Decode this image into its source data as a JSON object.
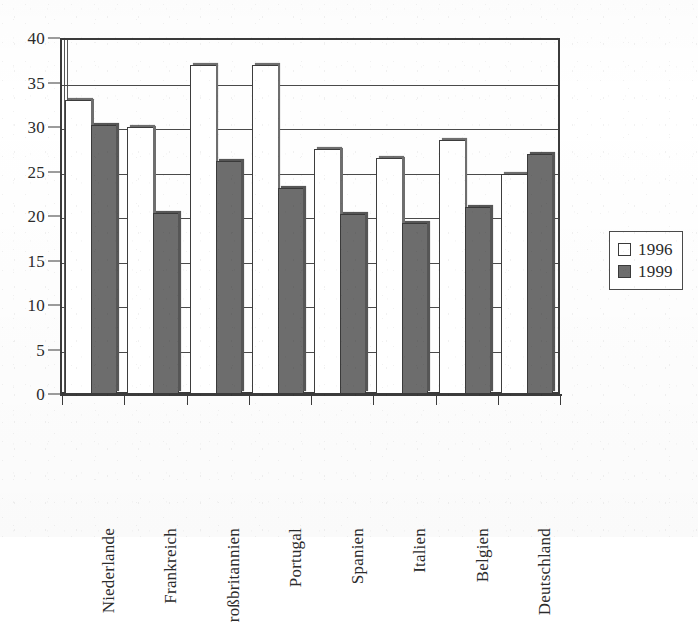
{
  "chart_data": {
    "type": "bar",
    "title": "",
    "xlabel": "",
    "ylabel": "",
    "ylim": [
      0,
      40
    ],
    "ytick_step": 5,
    "yticks": [
      0,
      5,
      10,
      15,
      20,
      25,
      30,
      35,
      40
    ],
    "grid": true,
    "legend_position": "right-outside",
    "categories": [
      "Niederlande",
      "Frankreich",
      "Großbritannien",
      "Portugal",
      "Spanien",
      "Italien",
      "Belgien",
      "Deutschland"
    ],
    "series": [
      {
        "name": "1996",
        "color": "#ffffff",
        "values": [
          33.0,
          30.0,
          37.0,
          37.0,
          27.5,
          26.5,
          28.5,
          24.7
        ]
      },
      {
        "name": "1999",
        "color": "#6d6d6d",
        "values": [
          30.2,
          20.3,
          26.2,
          23.2,
          20.2,
          19.2,
          21.0,
          27.0
        ]
      }
    ]
  },
  "legend": {
    "entries": [
      {
        "label": "1996",
        "swatch": "white-square"
      },
      {
        "label": "1999",
        "swatch": "dark-square"
      }
    ]
  },
  "axes": {
    "y_tick_labels": [
      "40",
      "35",
      "30",
      "25",
      "20",
      "15",
      "10",
      "5",
      "0"
    ],
    "x_tick_labels": [
      "Niederlande",
      "Frankreich",
      "roßbritannien",
      "Portugal",
      "Spanien",
      "Italien",
      "Belgien",
      "Deutschland"
    ]
  },
  "colors": {
    "series_1996": "#ffffff",
    "series_1999": "#6d6d6d",
    "axis": "#3b3b3b",
    "grid": "#4a4a4a",
    "text": "#2b2b2b",
    "background": "#ffffff"
  }
}
